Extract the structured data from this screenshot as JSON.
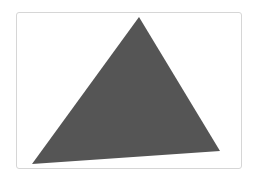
{
  "figure": {
    "shape": "triangle",
    "fill_color": "#555555",
    "frame_border_color": "#d6d6d6",
    "background_color": "#ffffff",
    "vertices": [
      [
        139,
        17
      ],
      [
        220,
        151
      ],
      [
        32,
        164
      ]
    ]
  }
}
